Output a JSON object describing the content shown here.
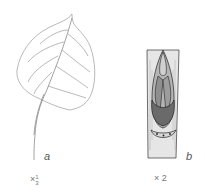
{
  "figure": {
    "panel_a": {
      "label": "a",
      "subject": "leaf-illustration",
      "scale_prefix": "×",
      "scale_num": "1",
      "scale_den": "3"
    },
    "panel_b": {
      "label": "b",
      "subject": "bud-on-twig-illustration",
      "scale": "× 2"
    },
    "colors": {
      "line": "#8a8a8a",
      "ink": "#333333"
    }
  }
}
